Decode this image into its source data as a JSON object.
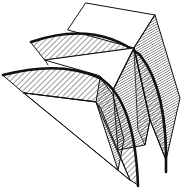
{
  "figure": {
    "colors": {
      "background": "#ffffff",
      "ink": "#111111",
      "light_hatch": "#3a3a3a",
      "dark_hatch": "#222222"
    },
    "faces": [
      {
        "id": "top-square",
        "fill": "none"
      },
      {
        "id": "upper-wing",
        "fill": "light-hatch"
      },
      {
        "id": "lower-wing",
        "fill": "light-hatch"
      },
      {
        "id": "right-side-face",
        "fill": "dark-hatch"
      },
      {
        "id": "inner-wedge-upper",
        "fill": "dark-hatch"
      },
      {
        "id": "inner-wedge-lower",
        "fill": "dark-hatch"
      },
      {
        "id": "lower-triangle",
        "fill": "none"
      },
      {
        "id": "middle-triangle",
        "fill": "none"
      }
    ]
  }
}
